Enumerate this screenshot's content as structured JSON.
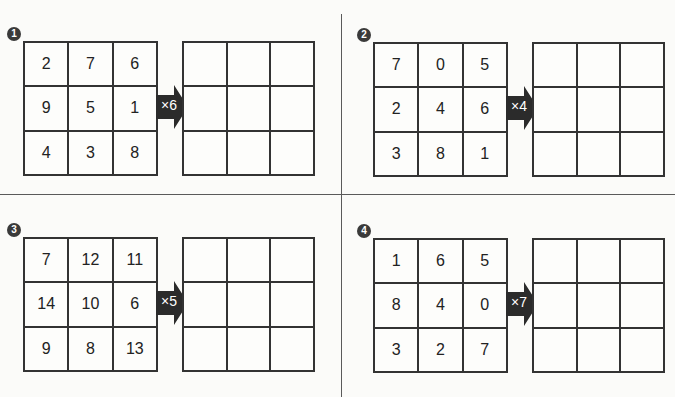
{
  "exercises": [
    {
      "number": "1",
      "multiplier": "×6",
      "input_grid": [
        [
          "2",
          "7",
          "6"
        ],
        [
          "9",
          "5",
          "1"
        ],
        [
          "4",
          "3",
          "8"
        ]
      ],
      "output_grid": [
        [
          "",
          "",
          ""
        ],
        [
          "",
          "",
          ""
        ],
        [
          "",
          "",
          ""
        ]
      ]
    },
    {
      "number": "2",
      "multiplier": "×4",
      "input_grid": [
        [
          "7",
          "0",
          "5"
        ],
        [
          "2",
          "4",
          "6"
        ],
        [
          "3",
          "8",
          "1"
        ]
      ],
      "output_grid": [
        [
          "",
          "",
          ""
        ],
        [
          "",
          "",
          ""
        ],
        [
          "",
          "",
          ""
        ]
      ]
    },
    {
      "number": "3",
      "multiplier": "×5",
      "input_grid": [
        [
          "7",
          "12",
          "11"
        ],
        [
          "14",
          "10",
          "6"
        ],
        [
          "9",
          "8",
          "13"
        ]
      ],
      "output_grid": [
        [
          "",
          "",
          ""
        ],
        [
          "",
          "",
          ""
        ],
        [
          "",
          "",
          ""
        ]
      ]
    },
    {
      "number": "4",
      "multiplier": "×7",
      "input_grid": [
        [
          "1",
          "6",
          "5"
        ],
        [
          "8",
          "4",
          "0"
        ],
        [
          "3",
          "2",
          "7"
        ]
      ],
      "output_grid": [
        [
          "",
          "",
          ""
        ],
        [
          "",
          "",
          ""
        ],
        [
          "",
          "",
          ""
        ]
      ]
    }
  ],
  "colors": {
    "arrow": "#2b2b2b",
    "grid_line": "#333333",
    "badge": "#3a3a3a",
    "background": "#fbfbf9"
  }
}
